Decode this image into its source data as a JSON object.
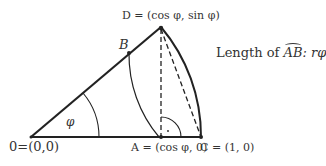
{
  "diagram": {
    "title_note": "Length of AB: rφ",
    "labels": {
      "D": "D = (cos φ, sin φ)",
      "B": "B",
      "O": "0=(0,0)",
      "A": "A = (cos φ, 0)",
      "C": "C = (1, 0)",
      "phi": "φ",
      "arc_length_prefix": "Length of ",
      "arc_name": "AB",
      "arc_length_suffix": ": rφ"
    },
    "points": {
      "O": [
        31,
        137
      ],
      "A": [
        161,
        137
      ],
      "C": [
        201,
        137
      ],
      "D": [
        161,
        27
      ],
      "B": [
        129,
        53
      ]
    },
    "colors": {
      "stroke": "#222222",
      "text": "#333333"
    }
  }
}
